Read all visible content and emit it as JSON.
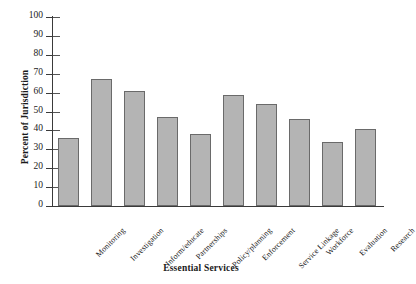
{
  "chart_data": {
    "type": "bar",
    "title": "",
    "xlabel": "Essential Services",
    "ylabel": "Percent of Jurisdiction",
    "categories": [
      "Monitoring",
      "Investigation",
      "Inform/educate",
      "Partnerships",
      "Policy/planning",
      "Enforcement",
      "Service Linkage",
      "Workforce",
      "Evaluation",
      "Research"
    ],
    "values": [
      36,
      67,
      61,
      47,
      38,
      59,
      54,
      46,
      34,
      41
    ],
    "ylim": [
      0,
      100
    ],
    "ytick_labels": [
      "100",
      "90",
      "80",
      "70",
      "60",
      "50",
      "40",
      "30",
      "20",
      "10",
      "0"
    ],
    "ytick_values": [
      100,
      90,
      80,
      70,
      60,
      50,
      40,
      30,
      20,
      10,
      0
    ],
    "grid": false,
    "legend": null,
    "bar_fill_color": "#b4b4b4",
    "bar_edge_color": "#6a6a6a",
    "axis_color": "#3a3a3a",
    "background_color": "#ffffff"
  }
}
